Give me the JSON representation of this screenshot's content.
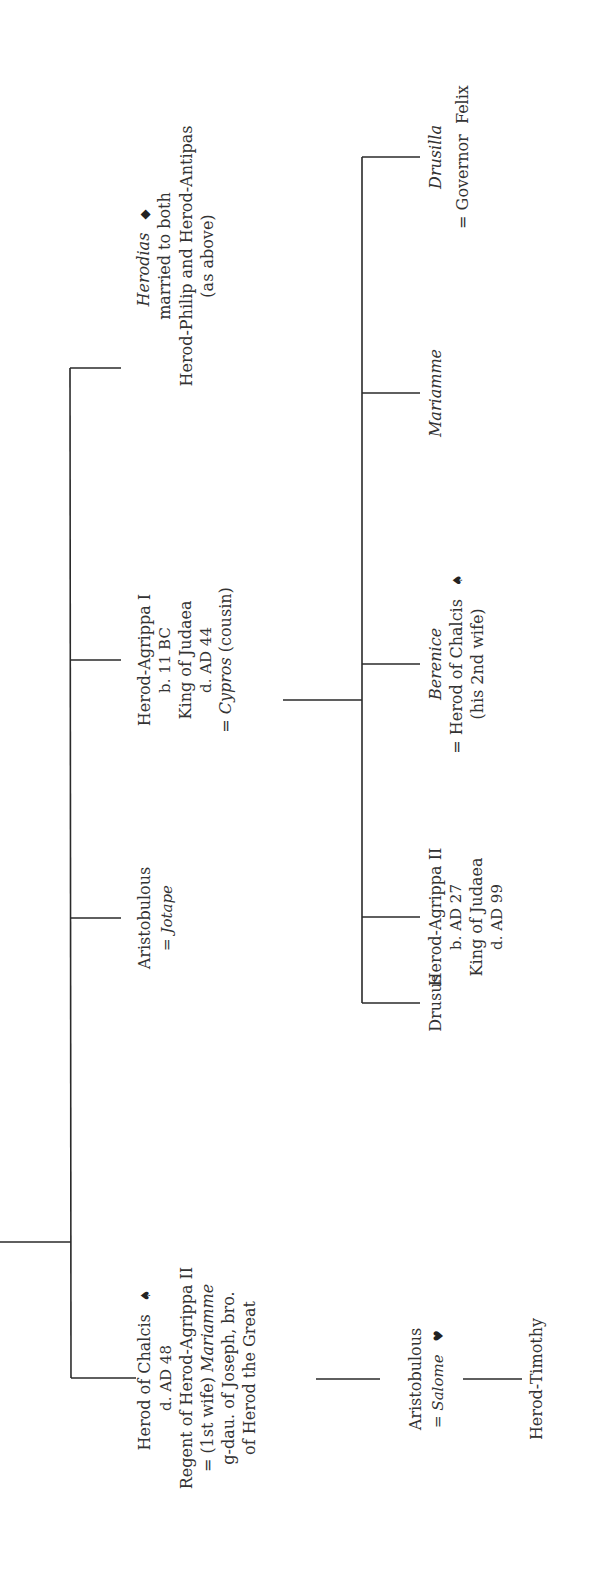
{
  "diagram": {
    "type": "family-tree",
    "orientation": "rotated-90-ccw",
    "line_color": "#2a2a2a",
    "text_color": "#333333"
  },
  "persons": {
    "herodias": {
      "name": "Herodias",
      "symbol": "◆",
      "lines": [
        "married to both",
        "Herod-Philip and Herod-Antipas",
        "(as above)"
      ]
    },
    "agrippa1": {
      "name": "Herod-Agrippa I",
      "lines": [
        "b. 11 BC",
        "King of Judaea",
        "d. AD 44"
      ],
      "spouse_prefix": "= ",
      "spouse": "Cypros",
      "spouse_note": " (cousin)"
    },
    "aristobulous1": {
      "name": "Aristobulous",
      "spouse_prefix": "= ",
      "spouse": "Jotape"
    },
    "chalcis": {
      "name": "Herod of Chalcis",
      "symbol": "♠",
      "lines": [
        "d. AD 48",
        "Regent of Herod-Agrippa II"
      ],
      "spouse_prefix": "= (1st wife) ",
      "spouse": "Mariamme",
      "tail_lines": [
        "g-dau. of Joseph, bro.",
        "of Herod the Great"
      ]
    },
    "drusus": {
      "name": "Drusus"
    },
    "agrippa2": {
      "name": "Herod-Agrippa II",
      "lines": [
        "b. AD 27",
        "King of Judaea",
        "d. AD 99"
      ]
    },
    "berenice": {
      "name": "Berenice",
      "lines": [
        "= Herod of Chalcis",
        "(his 2nd wife)"
      ],
      "symbol": "♠"
    },
    "mariamme": {
      "name": "Mariamme"
    },
    "drusilla": {
      "name": "Drusilla",
      "lines": [
        "= Governor  Felix"
      ]
    },
    "aristobulous2": {
      "name": "Aristobulous",
      "spouse_prefix": "= ",
      "spouse": "Salome",
      "symbol": "♥"
    },
    "timothy": {
      "name": "Herod-Timothy"
    }
  }
}
